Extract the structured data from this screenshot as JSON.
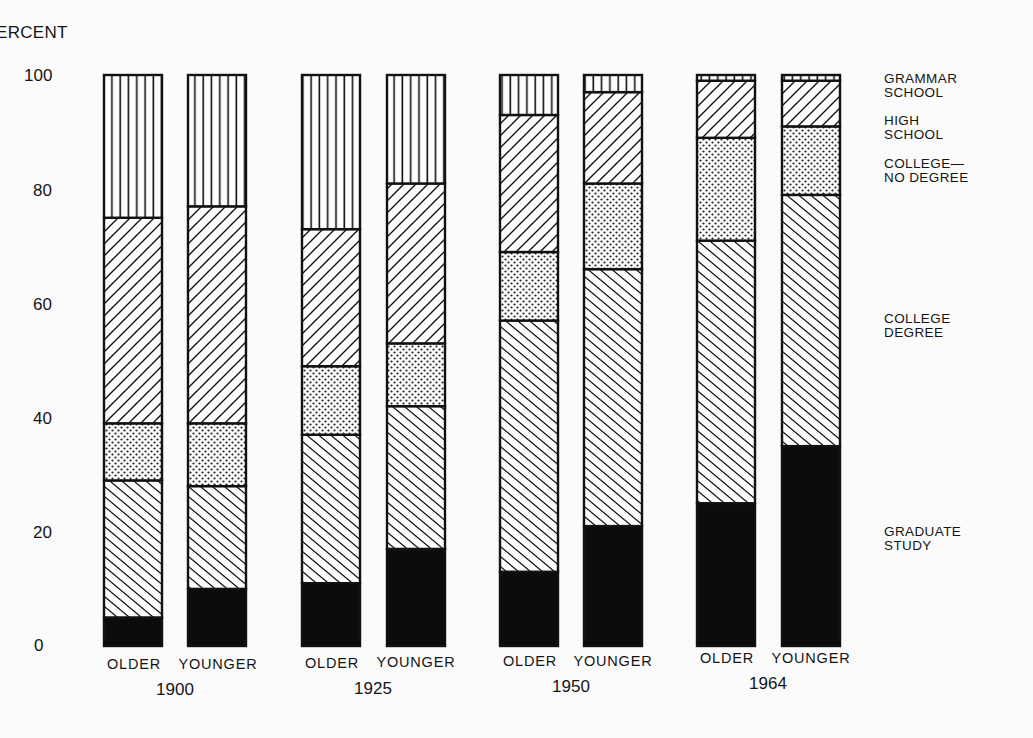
{
  "chart_data": {
    "type": "bar",
    "stacked": true,
    "title": "",
    "xlabel": "",
    "ylabel": "PERCENT",
    "ylim": [
      0,
      100
    ],
    "yticks": [
      "0",
      "20",
      "40",
      "60",
      "80",
      "100"
    ],
    "grid": false,
    "legend_position": "right",
    "groups": [
      "1900",
      "1925",
      "1950",
      "1964"
    ],
    "categories": [
      "OLDER",
      "YOUNGER",
      "OLDER",
      "YOUNGER",
      "OLDER",
      "YOUNGER",
      "OLDER",
      "YOUNGER"
    ],
    "category_groups": [
      "1900",
      "1900",
      "1925",
      "1925",
      "1950",
      "1950",
      "1964",
      "1964"
    ],
    "series": [
      {
        "name": "GRADUATE STUDY",
        "pattern": "solid-black",
        "values": [
          5,
          10,
          11,
          17,
          13,
          21,
          25,
          35
        ]
      },
      {
        "name": "COLLEGE DEGREE",
        "pattern": "backslash-hatch",
        "values": [
          24,
          18,
          26,
          25,
          44,
          45,
          46,
          44
        ]
      },
      {
        "name": "COLLEGE— NO DEGREE",
        "pattern": "dots",
        "values": [
          10,
          11,
          12,
          11,
          12,
          15,
          18,
          12
        ]
      },
      {
        "name": "HIGH SCHOOL",
        "pattern": "slash-hatch",
        "values": [
          36,
          38,
          24,
          28,
          24,
          16,
          10,
          8
        ]
      },
      {
        "name": "GRAMMAR SCHOOL",
        "pattern": "vertical-lines",
        "values": [
          25,
          23,
          27,
          19,
          7,
          3,
          1,
          1
        ]
      }
    ]
  },
  "axis": {
    "ylabel": "ERCENT",
    "ticks": [
      {
        "label": "100",
        "value": 100
      },
      {
        "label": "80",
        "value": 80
      },
      {
        "label": "60",
        "value": 60
      },
      {
        "label": "40",
        "value": 40
      },
      {
        "label": "20",
        "value": 20
      },
      {
        "label": "0",
        "value": 0
      }
    ]
  },
  "legend": [
    {
      "label": "GRAMMAR\nSCHOOL",
      "top": 72
    },
    {
      "label": "HIGH\nSCHOOL",
      "top": 114
    },
    {
      "label": "COLLEGE—\nNO DEGREE",
      "top": 157
    },
    {
      "label": "COLLEGE\nDEGREE",
      "top": 312
    },
    {
      "label": "GRADUATE\nSTUDY",
      "top": 525
    }
  ],
  "bars": [
    {
      "label": "OLDER",
      "x": 104,
      "group": "1900"
    },
    {
      "label": "YOUNGER",
      "x": 188,
      "group": "1900"
    },
    {
      "label": "OLDER",
      "x": 302,
      "group": "1925"
    },
    {
      "label": "YOUNGER",
      "x": 387,
      "group": "1925"
    },
    {
      "label": "OLDER",
      "x": 500,
      "group": "1950"
    },
    {
      "label": "YOUNGER",
      "x": 584,
      "group": "1950"
    },
    {
      "label": "OLDER",
      "x": 697,
      "group": "1964"
    },
    {
      "label": "YOUNGER",
      "x": 782,
      "group": "1964"
    }
  ],
  "group_labels": [
    {
      "label": "1900",
      "x": 175
    },
    {
      "label": "1925",
      "x": 373
    },
    {
      "label": "1950",
      "x": 571
    },
    {
      "label": "1964",
      "x": 768
    }
  ]
}
